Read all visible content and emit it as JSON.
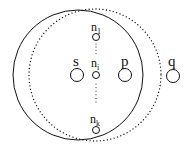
{
  "diagram": {
    "type": "node-range-diagram",
    "colors": {
      "stroke": "#111111",
      "background": "#ffffff"
    },
    "regions": [
      {
        "id": "solid-range",
        "style": "solid",
        "cx": 78,
        "cy": 75,
        "r": 65
      },
      {
        "id": "dotted-range",
        "style": "dotted",
        "cx": 95,
        "cy": 75,
        "r": 66
      }
    ],
    "nodes": [
      {
        "id": "n1",
        "label": "n",
        "subscript": "1",
        "cx": 96,
        "cy": 37,
        "r": 3.5
      },
      {
        "id": "s",
        "label": "s",
        "subscript": "",
        "cx": 77,
        "cy": 75,
        "r": 6.5
      },
      {
        "id": "ni",
        "label": "n",
        "subscript": "i",
        "cx": 96,
        "cy": 75,
        "r": 3.5
      },
      {
        "id": "p",
        "label": "p",
        "subscript": "",
        "cx": 125,
        "cy": 75,
        "r": 6.5
      },
      {
        "id": "q",
        "label": "q",
        "subscript": "",
        "cx": 173,
        "cy": 76,
        "r": 6.5
      },
      {
        "id": "nk",
        "label": "n",
        "subscript": "k",
        "cx": 96,
        "cy": 130,
        "r": 3.5
      }
    ],
    "ellipsis_connectors": [
      {
        "from": "n1",
        "to": "ni",
        "style": "dotted"
      },
      {
        "from": "ni",
        "to": "nk",
        "style": "dotted"
      }
    ],
    "labels": {
      "n1": {
        "base": "n",
        "sub": "1"
      },
      "s": {
        "base": "s"
      },
      "ni": {
        "base": "n",
        "sub": "i"
      },
      "p": {
        "base": "p"
      },
      "q": {
        "base": "q"
      },
      "nk": {
        "base": "n",
        "sub": "k"
      }
    }
  }
}
